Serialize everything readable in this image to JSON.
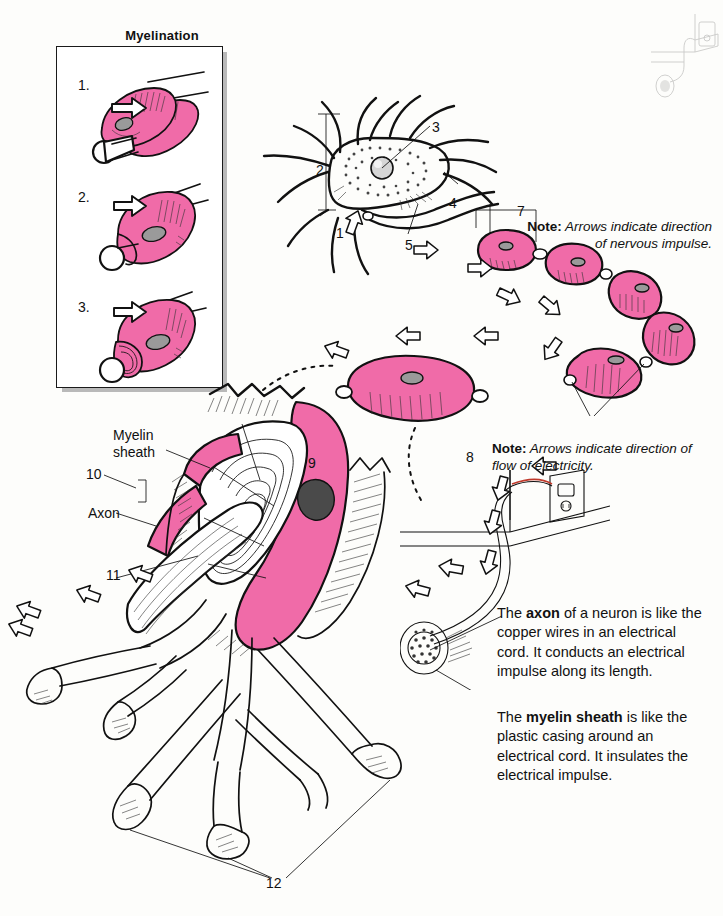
{
  "page": {
    "background_color": "#fdfdfb",
    "accent_pink": "#f06ba8",
    "ink_color": "#111111"
  },
  "inset": {
    "title": "Myelination",
    "steps": [
      {
        "number": "1.",
        "caption": "Schwann cell begins to wrap around the axon"
      },
      {
        "number": "2.",
        "caption": "Schwann cell envelops the axon"
      },
      {
        "number": "3.",
        "caption": "Schwann cell wraps in concentric layers"
      }
    ]
  },
  "neuron_labels": [
    {
      "id": "1",
      "text": "1"
    },
    {
      "id": "2",
      "text": "2"
    },
    {
      "id": "3",
      "text": "3"
    },
    {
      "id": "4",
      "text": "4"
    },
    {
      "id": "5",
      "text": "5"
    },
    {
      "id": "6",
      "text": "6"
    },
    {
      "id": "7",
      "text": "7"
    },
    {
      "id": "8",
      "text": "8"
    },
    {
      "id": "9",
      "text": "9"
    },
    {
      "id": "10",
      "text": "10"
    },
    {
      "id": "11",
      "text": "11"
    },
    {
      "id": "12",
      "text": "12"
    }
  ],
  "word_labels": {
    "myelin_sheath": "Myelin\nsheath",
    "myelin_sheath_line1": "Myelin",
    "myelin_sheath_line2": "sheath",
    "axon": "Axon"
  },
  "notes": [
    {
      "id": "note-nervous-impulse",
      "prefix": "Note:",
      "body": "Arrows indicate direction of nervous impulse.",
      "align": "right"
    },
    {
      "id": "note-electricity",
      "prefix": "Note:",
      "body": "Arrows indicate direction of flow of electricity.",
      "align": "left"
    }
  ],
  "blurbs": [
    {
      "id": "blurb-axon",
      "segments": [
        {
          "text": "The ",
          "bold": false
        },
        {
          "text": "axon",
          "bold": true
        },
        {
          "text": " of a neuron is like the copper wires in an electrical cord. It conducts an electrical impulse along its length.",
          "bold": false
        }
      ],
      "plain": "The axon of a neuron is like the copper wires in an electrical cord. It conducts an electrical impulse along its length."
    },
    {
      "id": "blurb-myelin",
      "segments": [
        {
          "text": "The ",
          "bold": false
        },
        {
          "text": "myelin sheath",
          "bold": true
        },
        {
          "text": " is like the plastic casing around an electrical cord. It insulates the electrical impulse.",
          "bold": false
        }
      ],
      "plain": "The myelin sheath is like the plastic casing around an electrical cord. It insulates the electrical impulse."
    }
  ],
  "icons": {
    "impulse_arrow": "hollow-block-arrow",
    "electricity_arrow": "hollow-block-arrow",
    "wall_outlet": "electrical-outlet-icon",
    "copper_wire_bundle": "wire-strand-bundle-icon"
  }
}
